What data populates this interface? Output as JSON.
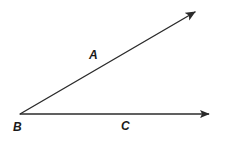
{
  "figure": {
    "kind": "geometry-angle-diagram",
    "width": 233,
    "height": 142,
    "background_color": "#ffffff",
    "stroke_color": "#2b2b2b",
    "label_color": "#1a1a1a",
    "stroke_width": 1.4
  },
  "labels": {
    "a": "A",
    "b": "B",
    "c": "C"
  },
  "label_positions": {
    "a": {
      "x": 89,
      "y": 49
    },
    "b": {
      "x": 13,
      "y": 121
    },
    "c": {
      "x": 121,
      "y": 120
    }
  },
  "geometry": {
    "vertex": {
      "x": 20,
      "y": 114
    },
    "ray_ba": {
      "name": "ray-BA",
      "from": {
        "x": 20,
        "y": 114
      },
      "to": {
        "x": 200,
        "y": 9
      },
      "arrowhead": "filled-triangle"
    },
    "ray_bc": {
      "name": "ray-BC",
      "from": {
        "x": 20,
        "y": 114
      },
      "to": {
        "x": 216,
        "y": 114
      },
      "arrowhead": "filled-triangle"
    }
  }
}
